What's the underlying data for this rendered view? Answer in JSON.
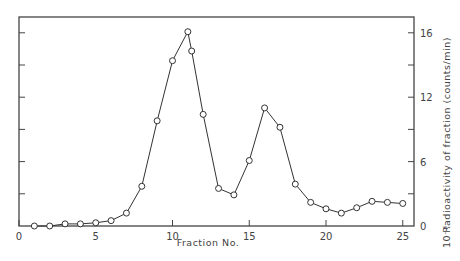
{
  "chart_data": {
    "type": "line",
    "title": "",
    "xlabel": "Fraction No.",
    "ylabel": "Radioactivity of fraction (counts/min)",
    "ylabel_multiplier": "10⁻⁶",
    "xlim": [
      0,
      25.8
    ],
    "ylim": [
      0,
      19.5
    ],
    "x_ticks": [
      0,
      5,
      10,
      15,
      20,
      25
    ],
    "x_tick_labels": [
      "0",
      "5",
      "10",
      "15",
      "20",
      "25"
    ],
    "y_ticks": [
      0,
      3,
      6,
      9,
      12,
      15,
      18
    ],
    "y_tick_labels": [
      {
        "value": 0,
        "label": "0"
      },
      {
        "value": 6,
        "label": "6"
      },
      {
        "value": 12,
        "label": "12"
      },
      {
        "value": 18,
        "label": "16"
      }
    ],
    "y_axis_position": "right",
    "grid": false,
    "legend": null,
    "marker": "open-circle",
    "series": [
      {
        "name": "Radioactivity",
        "x": [
          1,
          2,
          3,
          4,
          5,
          6,
          7,
          8,
          9,
          10,
          11,
          11.25,
          12,
          13,
          14,
          15,
          16,
          17,
          18,
          19,
          20,
          21,
          22,
          23,
          24,
          25
        ],
        "values": [
          0.0,
          0.0,
          0.2,
          0.2,
          0.3,
          0.5,
          1.2,
          3.7,
          9.8,
          15.4,
          18.1,
          16.3,
          10.4,
          3.5,
          2.9,
          6.1,
          11.0,
          9.2,
          3.9,
          2.2,
          1.6,
          1.2,
          1.7,
          2.3,
          2.2,
          2.1
        ]
      }
    ]
  },
  "colors": {
    "line": "#333333",
    "axis": "#444444",
    "marker_fill": "#ffffff"
  }
}
